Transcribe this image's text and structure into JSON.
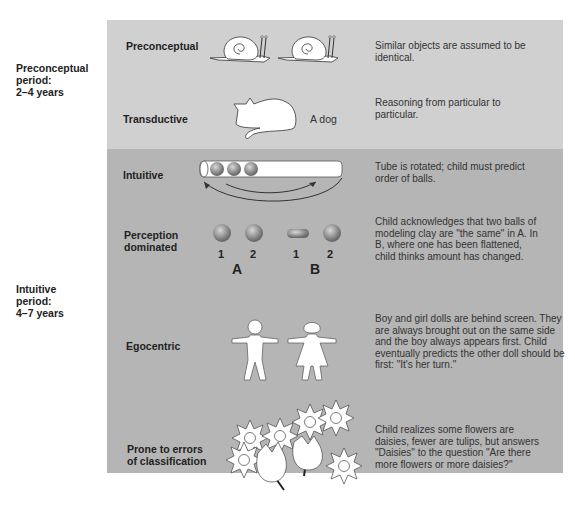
{
  "periods": [
    {
      "name": "Preconceptual",
      "line2": "period:",
      "ages": "2–4 years"
    },
    {
      "name": "Intuitive",
      "line2": "period:",
      "ages": "4–7 years"
    }
  ],
  "rows": [
    {
      "label": "Preconceptual",
      "description": "Similar objects are assumed to be identical.",
      "illustration": "two-snails"
    },
    {
      "label": "Transductive",
      "description": "Reasoning from particular to particular.",
      "illustration": "cat",
      "caption": "A dog"
    },
    {
      "label": "Intuitive",
      "description": "Tube is rotated; child must predict order of balls.",
      "illustration": "tube-with-balls"
    },
    {
      "label_line1": "Perception",
      "label_line2": "dominated",
      "description": "Child acknowledges that two balls of modeling clay are \"the same\" in A. In B, where one has been flattened, child thinks amount has changed.",
      "illustration": "clay-balls",
      "ball_numbers": [
        "1",
        "2",
        "1",
        "2"
      ],
      "group_labels": [
        "A",
        "B"
      ]
    },
    {
      "label": "Egocentric",
      "description": "Boy and girl dolls are behind screen. They are always brought out on the same side and the boy always appears first. Child eventually predicts the other doll should be first: \"It's her turn.\"",
      "illustration": "boy-and-girl-dolls"
    },
    {
      "label_line1": "Prone to errors",
      "label_line2": "of classification",
      "description": "Child realizes some flowers are daisies, fewer are tulips, but answers \"Daisies\" to the question \"Are there more flowers or more daisies?\"",
      "illustration": "daisies-and-tulips"
    }
  ],
  "colors": {
    "top_panel": "#d0d0d0",
    "bottom_panel": "#b5b5b5"
  }
}
